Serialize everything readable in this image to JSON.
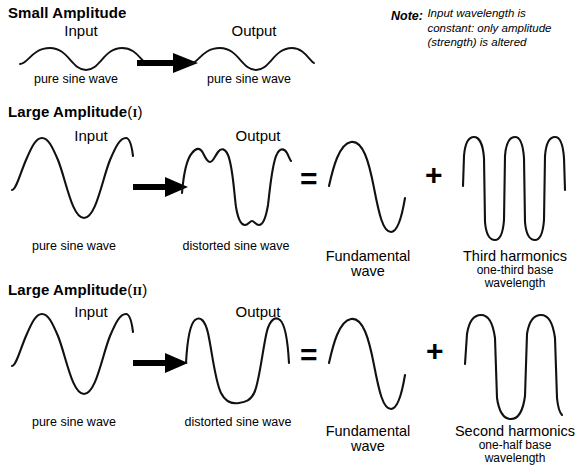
{
  "diagram": {
    "title_hidden": "Harmonic distortion of sine waves",
    "note": {
      "keyword": "Note:",
      "lines": [
        "Input wavelength is",
        "constant: only amplitude",
        "(strength) is altered"
      ]
    },
    "operators": {
      "equals": "=",
      "plus": "+",
      "arrow": "arrow-right"
    },
    "sections": [
      {
        "id": "small-amplitude",
        "heading": "Small Amplitude",
        "heading_roman": "",
        "items": [
          {
            "id": "input",
            "label": "Input",
            "caption": "pure sine wave",
            "caption_sub": ""
          },
          {
            "id": "output",
            "label": "Output",
            "caption": "pure sine wave",
            "caption_sub": ""
          }
        ]
      },
      {
        "id": "large-amplitude-1",
        "heading": "Large Amplitude",
        "heading_roman": "I",
        "items": [
          {
            "id": "input",
            "label": "Input",
            "caption": "pure sine wave",
            "caption_sub": ""
          },
          {
            "id": "output",
            "label": "Output",
            "caption": "distorted sine wave",
            "caption_sub": ""
          },
          {
            "id": "fundamental",
            "label": "",
            "caption": "Fundamental\nwave",
            "caption_sub": ""
          },
          {
            "id": "harmonic",
            "label": "",
            "caption": "Third harmonics",
            "caption_sub": "one-third base\nwavelength"
          }
        ]
      },
      {
        "id": "large-amplitude-2",
        "heading": "Large Amplitude",
        "heading_roman": "II",
        "items": [
          {
            "id": "input",
            "label": "Input",
            "caption": "pure sine wave",
            "caption_sub": ""
          },
          {
            "id": "output",
            "label": "Output",
            "caption": "distorted sine wave",
            "caption_sub": ""
          },
          {
            "id": "fundamental",
            "label": "",
            "caption": "Fundamental\nwave",
            "caption_sub": ""
          },
          {
            "id": "harmonic",
            "label": "",
            "caption": "Second harmonics",
            "caption_sub": "one-half base\nwavelength"
          }
        ]
      }
    ],
    "labels": {
      "s1_heading": "Small Amplitude",
      "s1_input_label": "Input",
      "s1_input_caption": "pure sine wave",
      "s1_output_label": "Output",
      "s1_output_caption": "pure sine wave",
      "s2_heading": "Large Amplitude",
      "s2_roman": "I",
      "s2_input_label": "Input",
      "s2_input_caption": "pure sine wave",
      "s2_output_label": "Output",
      "s2_output_caption": "distorted sine wave",
      "s2_fund_line1": "Fundamental",
      "s2_fund_line2": "wave",
      "s2_harm_line1": "Third harmonics",
      "s2_harm_line2": "one-third base",
      "s2_harm_line3": "wavelength",
      "s3_heading": "Large Amplitude",
      "s3_roman": "II",
      "s3_input_label": "Input",
      "s3_input_caption": "pure sine wave",
      "s3_output_label": "Output",
      "s3_output_caption": "distorted sine wave",
      "s3_fund_line1": "Fundamental",
      "s3_fund_line2": "wave",
      "s3_harm_line1": "Second harmonics",
      "s3_harm_line2": "one-half base",
      "s3_harm_line3": "wavelength",
      "paren_open": "(",
      "paren_close": ")",
      "equals": "=",
      "plus": "+"
    },
    "colors": {
      "stroke": "#111111",
      "text": "#000000",
      "background": "#ffffff"
    }
  }
}
